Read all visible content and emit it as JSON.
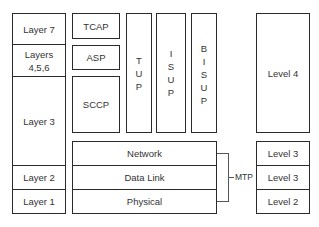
{
  "osi_stack": {
    "layer7": "Layer 7",
    "layers456_line1": "Layers",
    "layers456_line2": "4,5,6",
    "layer3": "Layer 3",
    "layer2": "Layer 2",
    "layer1": "Layer 1"
  },
  "ss7_stack": {
    "tcap": "TCAP",
    "asp": "ASP",
    "sccp": "SCCP",
    "tup": [
      "T",
      "U",
      "P"
    ],
    "isup": [
      "I",
      "S",
      "U",
      "P"
    ],
    "bisup": [
      "B",
      "I",
      "S",
      "U",
      "P"
    ],
    "network": "Network",
    "data_link": "Data Link",
    "physical": "Physical",
    "mtp_label": "MTP"
  },
  "levels": {
    "level4": "Level 4",
    "level3a": "Level 3",
    "level3b": "Level 3",
    "level2": "Level 2"
  }
}
